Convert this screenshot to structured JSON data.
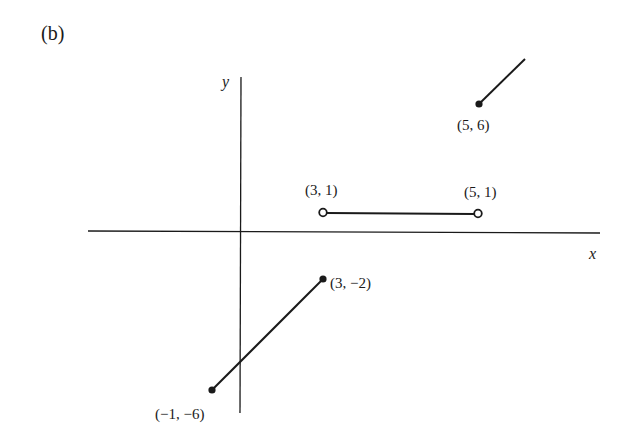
{
  "panel_label": "(b)",
  "axes": {
    "x_label": "x",
    "y_label": "y"
  },
  "points": [
    {
      "label": "(5, 6)",
      "type": "closed"
    },
    {
      "label": "(3, 1)",
      "type": "open"
    },
    {
      "label": "(5, 1)",
      "type": "open"
    },
    {
      "label": "(3, −2)",
      "type": "closed"
    },
    {
      "label": "(−1, −6)",
      "type": "closed"
    }
  ],
  "segments": [
    {
      "from": "(-1,-6)",
      "to": "(3,-2)",
      "endpoints": "closed-closed"
    },
    {
      "from": "(3,1)",
      "to": "(5,1)",
      "endpoints": "open-open"
    },
    {
      "from": "(5,6)",
      "to": "ray upward",
      "endpoints": "closed"
    }
  ],
  "colors": {
    "ink": "#1a1a1a",
    "background": "#ffffff"
  }
}
